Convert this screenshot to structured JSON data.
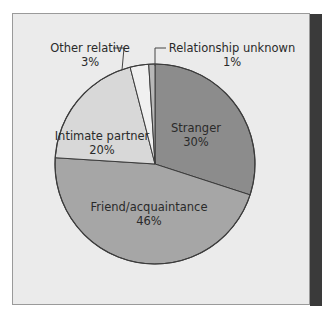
{
  "chart_data": {
    "type": "pie",
    "title": "",
    "slices": [
      {
        "label": "Stranger",
        "value": 30,
        "display": "30%",
        "color": "#8c8c8c"
      },
      {
        "label": "Friend/acquaintance",
        "value": 46,
        "display": "46%",
        "color": "#a6a6a6"
      },
      {
        "label": "Intimate partner",
        "value": 20,
        "display": "20%",
        "color": "#d8d8d8"
      },
      {
        "label": "Other relative",
        "value": 3,
        "display": "3%",
        "color": "#f0f0f0"
      },
      {
        "label": "Relationship unknown",
        "value": 1,
        "display": "1%",
        "color": "#b8b8b8"
      }
    ],
    "legend": "none",
    "start_angle": "12 o'clock, clockwise"
  },
  "labels": {
    "stranger": {
      "name": "Stranger",
      "pct": "30%"
    },
    "friend": {
      "name": "Friend/acquaintance",
      "pct": "46%"
    },
    "partner": {
      "name": "Intimate partner",
      "pct": "20%"
    },
    "relative": {
      "name": "Other relative",
      "pct": "3%"
    },
    "unknown": {
      "name": "Relationship unknown",
      "pct": "1%"
    }
  },
  "colors": {
    "frame_bg": "#ebebeb",
    "sidebar": "#3a3a3a",
    "outline": "#3c3c3c"
  }
}
